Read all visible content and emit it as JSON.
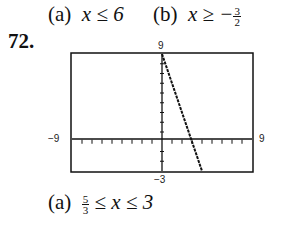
{
  "header": {
    "part_a_label": "(a)",
    "part_a_expr": "x ≤ 6",
    "part_b_label": "(b)",
    "part_b_expr_prefix": "x ≥ −",
    "part_b_frac_num": "3",
    "part_b_frac_den": "2"
  },
  "problem_number": "72.",
  "graph": {
    "ymax_label": "9",
    "ymin_label": "−3",
    "xmin_label": "−9",
    "xmax_label": "9"
  },
  "answer": {
    "part_a_label": "(a)",
    "frac_num": "5",
    "frac_den": "3",
    "expr": "≤ x ≤ 3"
  },
  "chart_data": {
    "type": "line",
    "title": "",
    "xlabel": "",
    "ylabel": "",
    "xlim": [
      -9,
      9
    ],
    "ylim": [
      -3,
      9
    ],
    "x_tick_step": 1,
    "y_tick_step": 1,
    "grid": false,
    "series": [
      {
        "name": "line",
        "x": [
          0,
          4
        ],
        "y": [
          9,
          -3
        ]
      }
    ],
    "window_labels": {
      "top": "9",
      "bottom": "-3",
      "left": "-9",
      "right": "9"
    }
  }
}
